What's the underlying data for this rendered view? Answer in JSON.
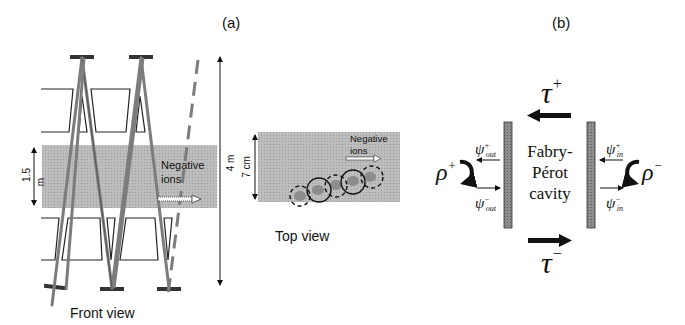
{
  "panel_a": {
    "label": "(a)",
    "front_view": {
      "caption": "Front view",
      "dimension_small": "1.5",
      "dimension_small_unit": "m",
      "beam_label_line1": "Negative",
      "beam_label_line2": "ions"
    },
    "height_dimension": "4 m",
    "top_view": {
      "caption": "Top view",
      "dimension": "7 cm",
      "beam_label_line1": "Negative",
      "beam_label_line2": "ions"
    }
  },
  "panel_b": {
    "label": "(b)",
    "tau_plus": "τ",
    "tau_plus_sup": "+",
    "tau_minus": "τ",
    "tau_minus_sup": "−",
    "rho_plus": "ρ",
    "rho_plus_sup": "+",
    "rho_minus": "ρ",
    "rho_minus_sup": "−",
    "psi_out_plus": "ψ",
    "psi_out_plus_sup": "+",
    "psi_out_plus_sub": "out",
    "psi_out_minus": "ψ",
    "psi_out_minus_sup": "−",
    "psi_out_minus_sub": "out",
    "psi_in_plus": "ψ",
    "psi_in_plus_sup": "+",
    "psi_in_plus_sub": "in",
    "psi_in_minus": "ψ",
    "psi_in_minus_sup": "−",
    "psi_in_minus_sub": "in",
    "cavity_line1": "Fabry-",
    "cavity_line2": "Pérot",
    "cavity_line3": "cavity"
  },
  "colors": {
    "ion_band": "#b4b4b4",
    "mirror": "#8a8a8a",
    "beam": "#7a7a7a",
    "ink": "#111111"
  }
}
